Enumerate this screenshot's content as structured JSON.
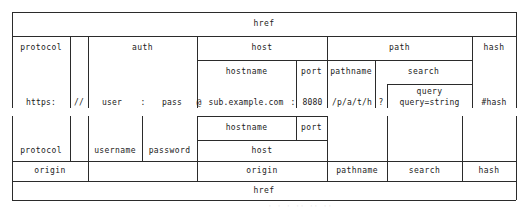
{
  "figure": {
    "example_url": "https://user:pass@sub.example.com:8080/p/a/t/h?query=string#hash"
  },
  "top": {
    "href": "href",
    "row2": {
      "protocol": "protocol",
      "auth": "auth",
      "host": "host",
      "path": "path",
      "hash": "hash"
    },
    "row3": {
      "hostname": "hostname",
      "port": "port",
      "pathname": "pathname",
      "search": "search"
    },
    "row4": {
      "query": "query"
    }
  },
  "values": {
    "protocol": "https:",
    "slashes": "//",
    "user": "user",
    "colon": ":",
    "pass": "pass",
    "at": "@",
    "hostname": "sub.example.com",
    "port_colon": ":",
    "port": "8080",
    "pathname": "/p/a/t/h",
    "question": "?",
    "query": "query=string",
    "hash": "#hash"
  },
  "bottom": {
    "row1": {
      "hostname": "hostname",
      "port": "port"
    },
    "row2": {
      "protocol": "protocol",
      "username": "username",
      "password": "password",
      "host": "host"
    },
    "row3": {
      "origin_left": "origin",
      "origin_right": "origin",
      "pathname": "pathname",
      "search": "search",
      "hash": "hash"
    },
    "row4": {
      "href": "href"
    }
  },
  "artifact": {
    "text": "· · ·  ·· ·· ··"
  },
  "colors": {
    "line": "#2b2b2b",
    "line_soft": "#555555",
    "text": "#1a1a1a",
    "background": "#ffffff"
  }
}
